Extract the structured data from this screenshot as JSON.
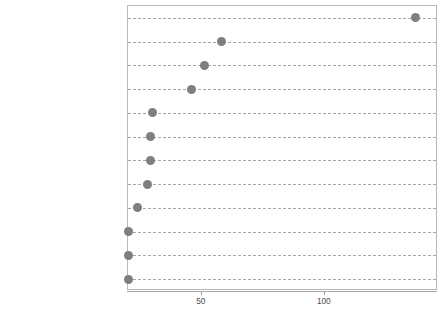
{
  "chart_data": {
    "type": "scatter",
    "title": "",
    "subtitle": "",
    "xlabel": "",
    "ylabel": "",
    "orientation": "horizontal",
    "grid": true,
    "gridline_style": "dashed",
    "legend": "none",
    "marker": {
      "shape": "circle",
      "color": "#7f7f7f",
      "size_px": 9
    },
    "xlim": [
      20,
      146
    ],
    "xticks": [
      50,
      100
    ],
    "xtick_labels": [
      "50",
      "100"
    ],
    "categories": [
      "academic libraries",
      "information literacy",
      "public libraries",
      "libraries",
      "open access",
      "library and information science",
      "bibliometrics",
      "university libraries",
      "library services",
      "social media",
      "collection development",
      "collaboration"
    ],
    "values": [
      137,
      58,
      51,
      46,
      30,
      29,
      29,
      28,
      24,
      20,
      20,
      20
    ],
    "points": [
      {
        "label": "academic libraries",
        "value": 137
      },
      {
        "label": "information literacy",
        "value": 58
      },
      {
        "label": "public libraries",
        "value": 51
      },
      {
        "label": "libraries",
        "value": 46
      },
      {
        "label": "open access",
        "value": 30
      },
      {
        "label": "library and information science",
        "value": 29
      },
      {
        "label": "bibliometrics",
        "value": 29
      },
      {
        "label": "university libraries",
        "value": 28
      },
      {
        "label": "library services",
        "value": 24
      },
      {
        "label": "social media",
        "value": 20
      },
      {
        "label": "collection development",
        "value": 20
      },
      {
        "label": "collaboration",
        "value": 20
      }
    ]
  },
  "colors": {
    "marker": "#7f7f7f",
    "gridline": "#a8a8a8",
    "panel_border": "#b9b9b9",
    "text": "#4d4d4d",
    "background": "#ffffff"
  }
}
